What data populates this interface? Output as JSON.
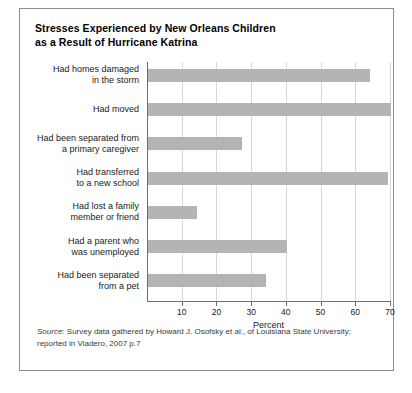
{
  "figure": {
    "title_line1": "Stresses Experienced by New Orleans Children",
    "title_line2": "as a Result of Hurricane Katrina",
    "source_prefix": "Source:",
    "source_line1": " Survey data gathered by Howard J. Osofsky et al., of Louisiana State University;",
    "source_line2": "reported in Viadero, 2007 p.7"
  },
  "chart_data": {
    "type": "bar",
    "orientation": "horizontal",
    "title": "Stresses Experienced by New Orleans Children as a Result of Hurricane Katrina",
    "xlabel": "Percent",
    "ylabel": "",
    "xlim": [
      0,
      70
    ],
    "xticks": [
      10,
      20,
      30,
      40,
      50,
      60,
      70
    ],
    "xtick_labels": [
      "10",
      "20",
      "30",
      "40",
      "50",
      "60",
      "70"
    ],
    "grid": true,
    "legend": false,
    "bar_color": "#b4b4b4",
    "categories": [
      [
        "Had homes damaged",
        "in the storm"
      ],
      [
        "Had moved"
      ],
      [
        "Had been separated from",
        "a primary caregiver"
      ],
      [
        "Had transferred",
        "to a new school"
      ],
      [
        "Had lost a family",
        "member or friend"
      ],
      [
        "Had a parent who",
        "was unemployed"
      ],
      [
        "Had been separated",
        "from a pet"
      ]
    ],
    "category_labels": [
      "Had homes damaged in the storm",
      "Had moved",
      "Had been separated from a primary caregiver",
      "Had transferred to a new school",
      "Had lost a family member or friend",
      "Had a parent who was unemployed",
      "Had been separated from a pet"
    ],
    "values": [
      64,
      70,
      27,
      69,
      14,
      40,
      34
    ]
  }
}
